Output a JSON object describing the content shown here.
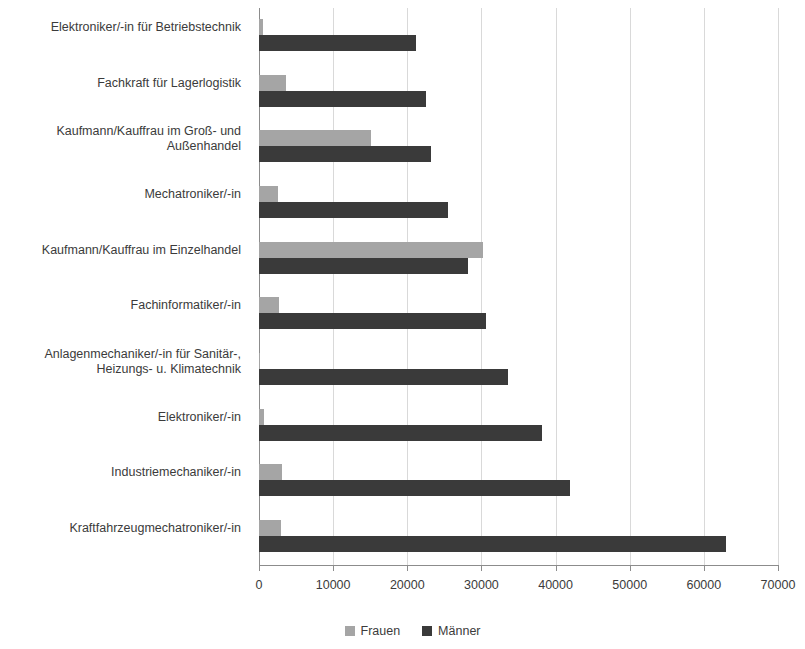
{
  "chart_data": {
    "type": "bar",
    "orientation": "horizontal",
    "title": "",
    "subtitle": "",
    "xlabel": "",
    "ylabel": "",
    "xlim": [
      0,
      70000
    ],
    "ylim": null,
    "grid": true,
    "grid_axis": "x",
    "legend_position": "bottom-center",
    "xticks": [
      0,
      10000,
      20000,
      30000,
      40000,
      50000,
      60000,
      70000
    ],
    "xticklabels": [
      "0",
      "10000",
      "20000",
      "30000",
      "40000",
      "50000",
      "60000",
      "70000"
    ],
    "categories": [
      "Elektroniker/-in für Betriebstechnik",
      "Fachkraft für Lagerlogistik",
      "Kaufmann/Kauffrau im Groß- und\nAußenhandel",
      "Mechatroniker/-in",
      "Kaufmann/Kauffrau im Einzelhandel",
      "Fachinformatiker/-in",
      "Anlagenmechaniker/-in für Sanitär-,\nHeizungs- u. Klimatechnik",
      "Elektroniker/-in",
      "Industriemechaniker/-in",
      "Kraftfahrzeugmechatroniker/-in"
    ],
    "series": [
      {
        "name": "Frauen",
        "color": "#a5a5a5",
        "values": [
          600,
          3600,
          15100,
          2500,
          30200,
          2700,
          200,
          700,
          3100,
          3000
        ]
      },
      {
        "name": "Männer",
        "color": "#3a3a3a",
        "values": [
          21200,
          22500,
          23200,
          25500,
          28200,
          30600,
          33600,
          38200,
          42000,
          63000
        ]
      }
    ],
    "annotations": []
  },
  "legend": {
    "items": [
      {
        "label": "Frauen",
        "color": "#a5a5a5"
      },
      {
        "label": "Männer",
        "color": "#3a3a3a"
      }
    ]
  },
  "axis": {
    "grid_color": "#d9d9d9",
    "axis_color": "#8c8c8c"
  }
}
